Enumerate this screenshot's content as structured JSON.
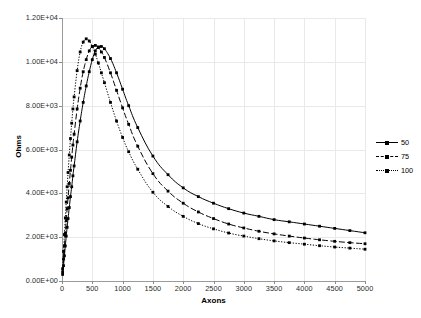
{
  "chart": {
    "type": "line",
    "title": "",
    "xlabel": "Axons",
    "ylabel": "Ohms"
  },
  "axes": {
    "y_ticks": [
      "0.00E+00",
      "2.00E+03",
      "4.00E+03",
      "6.00E+03",
      "8.00E+03",
      "1.00E+04",
      "1.20E+04"
    ],
    "x_ticks": [
      "0",
      "500",
      "1000",
      "1500",
      "2000",
      "2500",
      "3000",
      "3500",
      "4000",
      "4500",
      "5000"
    ],
    "ylim": [
      0,
      12000
    ],
    "xlim": [
      0,
      5000
    ],
    "grid": "both"
  },
  "legend": {
    "position": "right",
    "entries": [
      {
        "label": "50",
        "style": "solid",
        "marker": "square"
      },
      {
        "label": "75",
        "style": "dashed",
        "marker": "square"
      },
      {
        "label": "100",
        "style": "dotted",
        "marker": "square"
      }
    ]
  },
  "chart_data": {
    "type": "line",
    "title": "",
    "xlabel": "Axons",
    "ylabel": "Ohms",
    "xlim": [
      0,
      5000
    ],
    "ylim": [
      0,
      12000
    ],
    "grid": true,
    "legend_position": "right",
    "series": [
      {
        "name": "50",
        "style": "solid",
        "x": [
          10,
          25,
          40,
          55,
          70,
          85,
          100,
          120,
          140,
          160,
          180,
          200,
          250,
          300,
          350,
          400,
          450,
          500,
          550,
          600,
          650,
          700,
          800,
          900,
          1000,
          1100,
          1250,
          1500,
          1750,
          2000,
          2250,
          2500,
          2750,
          3000,
          3250,
          3500,
          3750,
          4000,
          4250,
          4500,
          4750,
          5000
        ],
        "y": [
          300,
          700,
          1150,
          1600,
          2050,
          2450,
          2850,
          3350,
          3850,
          4300,
          4800,
          5250,
          6350,
          7300,
          8150,
          8900,
          9550,
          10100,
          10500,
          10680,
          10700,
          10600,
          10150,
          9500,
          8750,
          8000,
          7000,
          5700,
          4850,
          4250,
          3850,
          3550,
          3300,
          3100,
          2950,
          2800,
          2700,
          2600,
          2500,
          2400,
          2300,
          2200
        ]
      },
      {
        "name": "75",
        "style": "dashed",
        "x": [
          10,
          25,
          40,
          55,
          70,
          85,
          100,
          120,
          140,
          160,
          180,
          200,
          250,
          300,
          350,
          400,
          450,
          500,
          550,
          600,
          650,
          700,
          800,
          900,
          1000,
          1100,
          1250,
          1500,
          1750,
          2000,
          2250,
          2500,
          2750,
          3000,
          3250,
          3500,
          3750,
          4000,
          4250,
          4500,
          4750,
          5000
        ],
        "y": [
          420,
          1000,
          1600,
          2200,
          2750,
          3300,
          3800,
          4450,
          5050,
          5650,
          6200,
          6700,
          7850,
          8800,
          9550,
          10100,
          10500,
          10700,
          10750,
          10650,
          10450,
          10200,
          9500,
          8700,
          7900,
          7150,
          6150,
          4900,
          4100,
          3550,
          3150,
          2850,
          2600,
          2420,
          2270,
          2150,
          2050,
          1960,
          1880,
          1810,
          1750,
          1700
        ]
      },
      {
        "name": "100",
        "style": "dotted",
        "x": [
          10,
          25,
          40,
          55,
          70,
          85,
          100,
          120,
          140,
          160,
          180,
          200,
          250,
          300,
          350,
          400,
          450,
          500,
          550,
          600,
          650,
          700,
          800,
          900,
          1000,
          1100,
          1250,
          1500,
          1750,
          2000,
          2250,
          2500,
          2750,
          3000,
          3250,
          3500,
          3750,
          4000,
          4250,
          4500,
          4750,
          5000
        ],
        "y": [
          560,
          1350,
          2120,
          2880,
          3600,
          4300,
          4950,
          5750,
          6500,
          7200,
          7850,
          8400,
          9600,
          10450,
          10900,
          11050,
          10950,
          10700,
          10350,
          9950,
          9500,
          9050,
          8150,
          7300,
          6550,
          5900,
          5100,
          4050,
          3400,
          2950,
          2620,
          2380,
          2190,
          2050,
          1930,
          1830,
          1750,
          1680,
          1610,
          1550,
          1500,
          1450
        ]
      }
    ]
  }
}
